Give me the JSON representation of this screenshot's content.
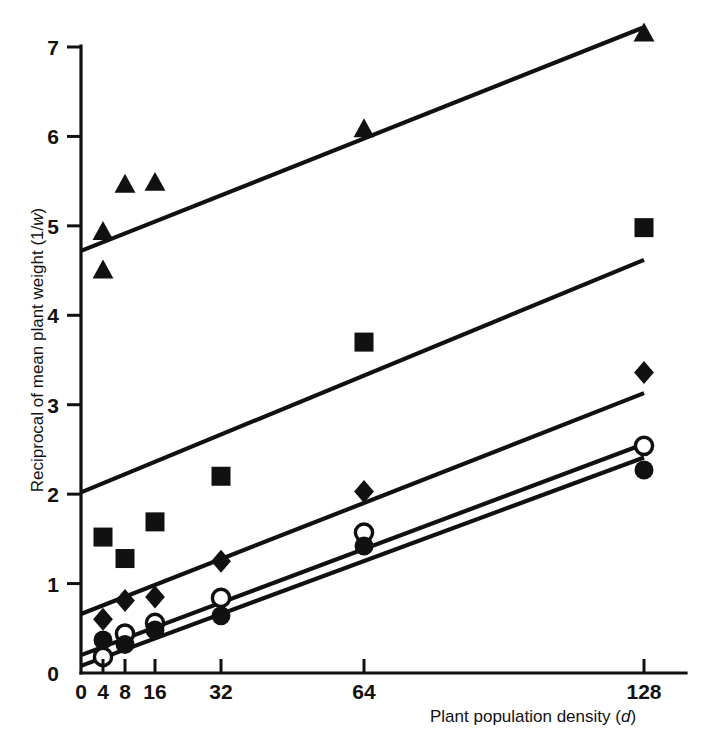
{
  "figure": {
    "name": "reciprocal-plant-weight-vs-density",
    "background_color": "#ffffff",
    "ink_color": "#111111"
  },
  "axes": {
    "y": {
      "title_prefix": "Reciprocal of mean plant weight (1/",
      "title_italic": "w",
      "title_suffix": ")",
      "title_full": "Reciprocal of mean plant weight (1/w)",
      "ticks": [
        "7",
        "6",
        "5",
        "4",
        "3",
        "2",
        "1",
        "0"
      ],
      "tick_values": [
        7,
        6,
        5,
        4,
        3,
        2,
        1,
        0
      ],
      "min": 0,
      "max": 7.35
    },
    "x": {
      "title_prefix": "Plant population density (",
      "title_italic": "d",
      "title_suffix": ")",
      "title_full": "Plant population density (d)",
      "ticks": [
        "0",
        "4",
        "8",
        "16",
        "32",
        "64",
        "128"
      ],
      "tick_values": [
        0,
        4,
        8,
        16,
        32,
        64,
        128
      ],
      "min": 0,
      "max": 128
    }
  },
  "chart_data": {
    "type": "scatter",
    "title": "",
    "xlabel": "Plant population density (d)",
    "ylabel": "Reciprocal of mean plant weight (1/w)",
    "xlim": [
      0,
      128
    ],
    "ylim": [
      0,
      7.35
    ],
    "grid": false,
    "legend": "none",
    "x_tick_positions_px": [
      81,
      103,
      125,
      155,
      221,
      364,
      644
    ],
    "x_tick_values": [
      0,
      4,
      8,
      16,
      32,
      64,
      128
    ],
    "series": [
      {
        "name": "filled-triangle",
        "marker": "triangle-filled",
        "points": [
          {
            "x": 4,
            "y": 4.93
          },
          {
            "x": 4,
            "y": 4.5
          },
          {
            "x": 8,
            "y": 5.46
          },
          {
            "x": 16,
            "y": 5.48
          },
          {
            "x": 64,
            "y": 6.08
          },
          {
            "x": 128,
            "y": 7.15
          }
        ],
        "fit_line": {
          "x_start": 0,
          "y_start": 4.72,
          "x_end": 128,
          "y_end": 7.22
        }
      },
      {
        "name": "filled-square",
        "marker": "square-filled",
        "points": [
          {
            "x": 4,
            "y": 1.52
          },
          {
            "x": 8,
            "y": 1.28
          },
          {
            "x": 16,
            "y": 1.69
          },
          {
            "x": 32,
            "y": 2.2
          },
          {
            "x": 64,
            "y": 3.7
          },
          {
            "x": 128,
            "y": 4.98
          }
        ],
        "fit_line": {
          "x_start": 0,
          "y_start": 2.02,
          "x_end": 128,
          "y_end": 4.62
        }
      },
      {
        "name": "filled-diamond",
        "marker": "diamond-filled",
        "points": [
          {
            "x": 4,
            "y": 0.6
          },
          {
            "x": 8,
            "y": 0.81
          },
          {
            "x": 16,
            "y": 0.85
          },
          {
            "x": 32,
            "y": 1.25
          },
          {
            "x": 64,
            "y": 2.03
          },
          {
            "x": 128,
            "y": 3.36
          }
        ],
        "fit_line": {
          "x_start": 0,
          "y_start": 0.66,
          "x_end": 128,
          "y_end": 3.13
        }
      },
      {
        "name": "open-circle",
        "marker": "circle-open",
        "points": [
          {
            "x": 4,
            "y": 0.18
          },
          {
            "x": 8,
            "y": 0.44
          },
          {
            "x": 16,
            "y": 0.56
          },
          {
            "x": 32,
            "y": 0.84
          },
          {
            "x": 64,
            "y": 1.57
          },
          {
            "x": 128,
            "y": 2.54
          }
        ],
        "fit_line": {
          "x_start": 0,
          "y_start": 0.2,
          "x_end": 128,
          "y_end": 2.56
        }
      },
      {
        "name": "filled-circle",
        "marker": "circle-filled",
        "points": [
          {
            "x": 4,
            "y": 0.37
          },
          {
            "x": 8,
            "y": 0.32
          },
          {
            "x": 16,
            "y": 0.48
          },
          {
            "x": 32,
            "y": 0.64
          },
          {
            "x": 64,
            "y": 1.42
          },
          {
            "x": 128,
            "y": 2.27
          }
        ],
        "fit_line": {
          "x_start": 0,
          "y_start": 0.08,
          "x_end": 128,
          "y_end": 2.41
        }
      }
    ]
  }
}
